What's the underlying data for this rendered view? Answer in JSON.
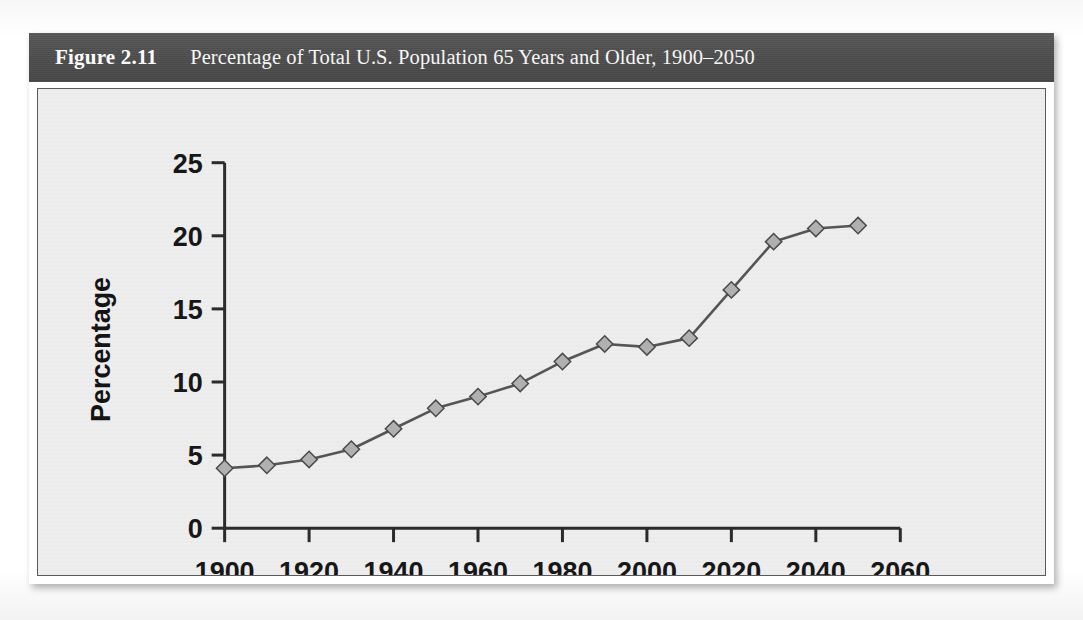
{
  "figure": {
    "number": "Figure 2.11",
    "caption": "Percentage of Total U.S. Population 65 Years and Older, 1900–2050",
    "header_bg": "#4e4e4e",
    "panel_bg": "#eeeeee",
    "source_note": ""
  },
  "chart_data": {
    "type": "line",
    "title": "Percentage of Total U.S. Population 65 Years and Older, 1900–2050",
    "xlabel": "",
    "ylabel": "Percentage",
    "x": [
      1900,
      1910,
      1920,
      1930,
      1940,
      1950,
      1960,
      1970,
      1980,
      1990,
      2000,
      2010,
      2020,
      2030,
      2040,
      2050
    ],
    "values": [
      4.1,
      4.3,
      4.7,
      5.4,
      6.8,
      8.2,
      9.0,
      9.9,
      11.4,
      12.6,
      12.4,
      13.0,
      16.3,
      19.6,
      20.5,
      20.7
    ],
    "series": [
      {
        "name": "Percentage 65 and older",
        "values": [
          4.1,
          4.3,
          4.7,
          5.4,
          6.8,
          8.2,
          9.0,
          9.9,
          11.4,
          12.6,
          12.4,
          13.0,
          16.3,
          19.6,
          20.5,
          20.7
        ]
      }
    ],
    "xlim": [
      1900,
      2060
    ],
    "ylim": [
      0,
      25
    ],
    "xticks": [
      1900,
      1920,
      1940,
      1960,
      1980,
      2000,
      2020,
      2040,
      2060
    ],
    "xtick_labels": [
      "1900",
      "1920",
      "1940",
      "1960",
      "1980",
      "2000",
      "2020",
      "2040",
      "2060"
    ],
    "yticks": [
      0,
      5,
      10,
      15,
      20,
      25
    ],
    "ytick_labels": [
      "0",
      "5",
      "10",
      "15",
      "20",
      "25"
    ],
    "grid": false,
    "legend": false,
    "legend_position": "none",
    "marker": "diamond",
    "marker_fill": "#b0b0b0",
    "marker_edge": "#4a4a4a",
    "line_color": "#555555",
    "axis_color": "#2b2b2b"
  }
}
